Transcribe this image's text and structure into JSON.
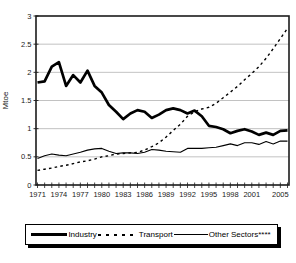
{
  "figure": {
    "background": "#ffffff",
    "line_color": "#000000",
    "grid_color": "#b3b3b3"
  },
  "chart_data": {
    "type": "line",
    "ylabel": "Mtoe",
    "ylim": [
      0,
      3
    ],
    "yticks": [
      0,
      0.5,
      1,
      1.5,
      2,
      2.5,
      3
    ],
    "ytick_labels": [
      "0",
      "0.5",
      "1",
      "1.5",
      "2",
      "2.5",
      "3"
    ],
    "x": [
      1971,
      1972,
      1973,
      1974,
      1975,
      1976,
      1977,
      1978,
      1979,
      1980,
      1981,
      1982,
      1983,
      1984,
      1985,
      1986,
      1987,
      1988,
      1989,
      1990,
      1991,
      1992,
      1993,
      1994,
      1995,
      1996,
      1997,
      1998,
      1999,
      2000,
      2001,
      2002,
      2003,
      2004,
      2005,
      2006
    ],
    "x_tick_labels": [
      "1971",
      "1974",
      "1977",
      "1980",
      "1983",
      "1986",
      "1989",
      "1992",
      "1995",
      "1998",
      "2001",
      "2005"
    ],
    "grid": "horizontal-only",
    "legend_position": "bottom",
    "series": [
      {
        "name": "Industry",
        "line_style": "thick-solid",
        "color": "#000000",
        "values": [
          1.82,
          1.84,
          2.1,
          2.18,
          1.76,
          1.95,
          1.82,
          2.03,
          1.76,
          1.64,
          1.42,
          1.3,
          1.17,
          1.27,
          1.33,
          1.3,
          1.19,
          1.25,
          1.33,
          1.36,
          1.33,
          1.27,
          1.32,
          1.22,
          1.05,
          1.03,
          0.99,
          0.92,
          0.96,
          0.99,
          0.95,
          0.89,
          0.93,
          0.89,
          0.96,
          0.97
        ]
      },
      {
        "name": "Transport",
        "line_style": "dashed",
        "color": "#000000",
        "values": [
          0.26,
          0.28,
          0.3,
          0.33,
          0.35,
          0.38,
          0.41,
          0.43,
          0.46,
          0.5,
          0.52,
          0.55,
          0.56,
          0.57,
          0.58,
          0.62,
          0.68,
          0.75,
          0.85,
          0.97,
          1.08,
          1.22,
          1.3,
          1.35,
          1.38,
          1.45,
          1.55,
          1.65,
          1.75,
          1.87,
          1.98,
          2.1,
          2.25,
          2.42,
          2.6,
          2.78
        ]
      },
      {
        "name": "Other Sectors****",
        "line_style": "thin-solid",
        "color": "#000000",
        "values": [
          0.47,
          0.52,
          0.55,
          0.53,
          0.52,
          0.55,
          0.58,
          0.62,
          0.64,
          0.65,
          0.6,
          0.56,
          0.57,
          0.57,
          0.56,
          0.58,
          0.63,
          0.62,
          0.6,
          0.59,
          0.58,
          0.65,
          0.65,
          0.65,
          0.66,
          0.67,
          0.7,
          0.73,
          0.7,
          0.75,
          0.75,
          0.72,
          0.77,
          0.73,
          0.78,
          0.78
        ]
      }
    ]
  }
}
